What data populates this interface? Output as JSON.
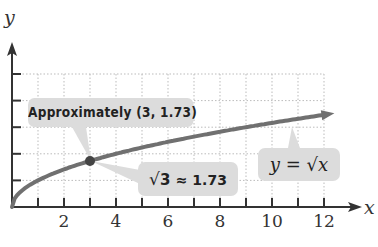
{
  "chart_data": {
    "type": "line",
    "title": "",
    "function": "y = sqrt(x)",
    "xlabel": "x",
    "ylabel": "y",
    "xlim": [
      0,
      13.5
    ],
    "ylim": [
      0,
      6
    ],
    "x_ticks": [
      1,
      2,
      3,
      4,
      5,
      6,
      7,
      8,
      9,
      10,
      11,
      12
    ],
    "x_tick_labels": [
      "2",
      "4",
      "6",
      "8",
      "10",
      "12"
    ],
    "y_ticks": [
      1,
      2,
      3,
      4,
      5
    ],
    "grid": true,
    "grid_style": "dotted",
    "series": [
      {
        "name": "y = √x",
        "x": [
          0,
          0.5,
          1,
          2,
          3,
          4,
          5,
          6,
          7,
          8,
          9,
          10,
          11,
          12,
          12.4
        ],
        "values": [
          0,
          0.71,
          1,
          1.41,
          1.73,
          2,
          2.24,
          2.45,
          2.65,
          2.83,
          3,
          3.16,
          3.32,
          3.46,
          3.52
        ],
        "color": "#707070",
        "arrow_end": true
      }
    ],
    "highlighted_point": {
      "x": 3,
      "y": 1.73
    },
    "annotations": [
      {
        "text": "Approximately (3, 1.73)",
        "points_to": [
          3,
          1.73
        ]
      },
      {
        "text": "√3 ≈ 1.73",
        "points_to": [
          3,
          1.73
        ]
      },
      {
        "text": "y = √x",
        "points_to": "curve"
      }
    ]
  },
  "labels": {
    "x_axis": "x",
    "y_axis": "y",
    "x_ticks": [
      "2",
      "4",
      "6",
      "8",
      "10",
      "12"
    ],
    "callout_point": "Approximately (3, 1.73)",
    "callout_sqrt_radicand": "3",
    "callout_sqrt_value": "≈ 1.73",
    "callout_func_lhs": "y =",
    "callout_func_radicand": "x"
  },
  "colors": {
    "curve": "#707070",
    "axis": "#333333",
    "grid": "#bbbbbb",
    "callout_bg": "#dcdcdc",
    "point": "#444444"
  }
}
